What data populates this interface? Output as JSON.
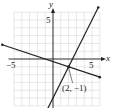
{
  "chart_data": {
    "type": "line",
    "title": "",
    "xlabel": "x",
    "ylabel": "y",
    "xlim": [
      -5,
      6
    ],
    "ylim": [
      -6,
      6
    ],
    "grid": true,
    "x_ticks_labeled": [
      "-5",
      "5"
    ],
    "y_ticks_labeled": [
      "5"
    ],
    "series": [
      {
        "name": "line-1",
        "equation": "y = 2x - 5",
        "x": [
          -1,
          5.8
        ],
        "y": [
          -7,
          6.6
        ]
      },
      {
        "name": "line-2",
        "equation": "y = -(x + 1)/3",
        "x": [
          -6.5,
          6
        ],
        "y": [
          1.83,
          -2.33
        ]
      }
    ],
    "annotations": [
      {
        "text": "(2, −1)",
        "point": [
          2,
          -1
        ]
      }
    ]
  },
  "labels": {
    "x_axis": "x",
    "y_axis": "y",
    "x_neg5": "−5",
    "x_pos5": "5",
    "y_pos5": "5",
    "point": "(2, −1)"
  },
  "colors": {
    "grid": "#d6d6d6",
    "axis": "#222222",
    "line": "#222222"
  }
}
